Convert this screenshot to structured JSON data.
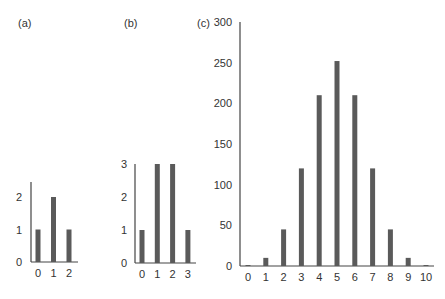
{
  "chart_data": [
    {
      "type": "bar",
      "title": "(a)",
      "categories": [
        "0",
        "1",
        "2"
      ],
      "values": [
        1,
        2,
        1
      ],
      "xlabel": "",
      "ylabel": "",
      "yticks": [
        "0",
        "1",
        "2"
      ],
      "ylim": [
        0,
        2.4
      ],
      "grid": false
    },
    {
      "type": "bar",
      "title": "(b)",
      "categories": [
        "0",
        "1",
        "2",
        "3"
      ],
      "values": [
        1,
        3,
        3,
        1
      ],
      "xlabel": "",
      "ylabel": "",
      "yticks": [
        "0",
        "1",
        "2",
        "3"
      ],
      "ylim": [
        0,
        3
      ],
      "grid": false
    },
    {
      "type": "bar",
      "title": "(c)",
      "categories": [
        "0",
        "1",
        "2",
        "3",
        "4",
        "5",
        "6",
        "7",
        "8",
        "9",
        "10"
      ],
      "values": [
        1,
        10,
        45,
        120,
        210,
        252,
        210,
        120,
        45,
        10,
        1
      ],
      "xlabel": "",
      "ylabel": "",
      "yticks": [
        "0",
        "50",
        "100",
        "150",
        "200",
        "250",
        "300"
      ],
      "ylim": [
        0,
        300
      ],
      "grid": false
    }
  ],
  "colors": {
    "bar": "#5a5a5a",
    "axis": "#444444",
    "text": "#333333"
  }
}
